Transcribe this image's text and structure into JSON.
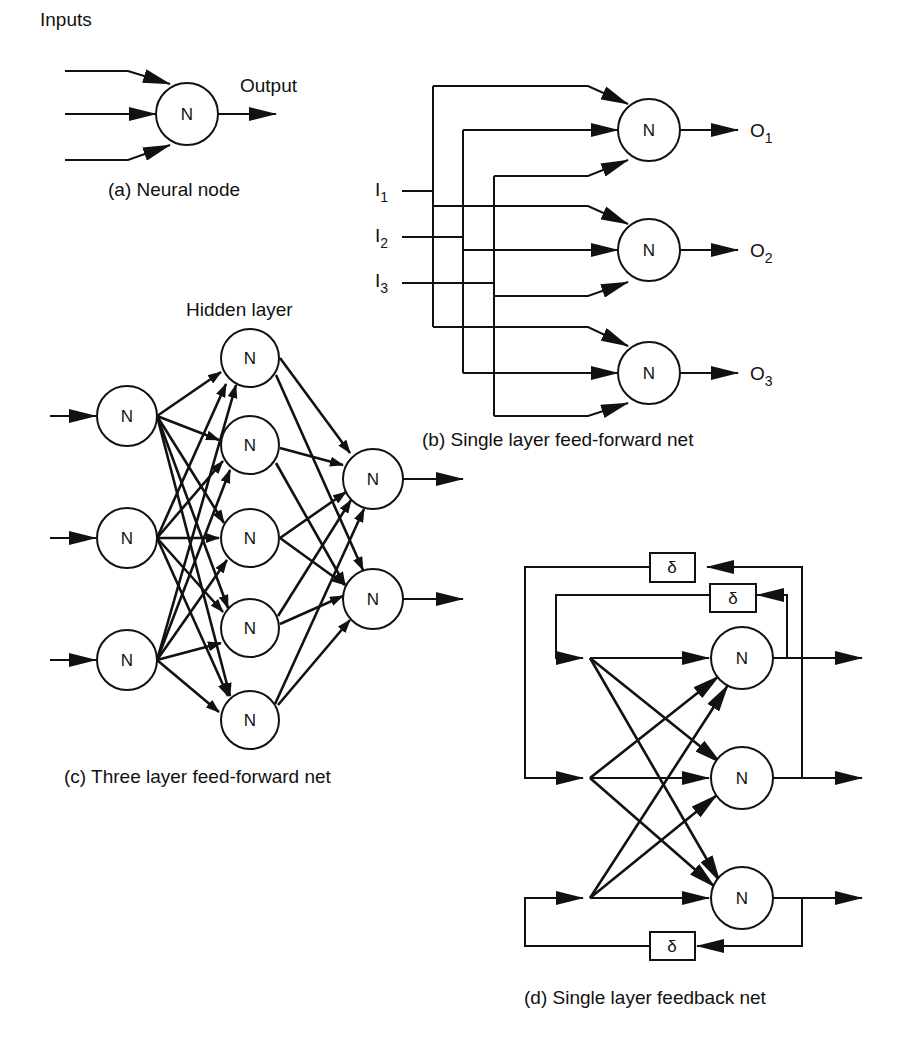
{
  "panels": {
    "a": {
      "caption": "(a) Neural node",
      "inputs_label": "Inputs",
      "output_label": "Output",
      "node_label": "N"
    },
    "b": {
      "caption": "(b) Single layer feed-forward net",
      "node_label": "N",
      "inputs": [
        {
          "base": "I",
          "sub": "1"
        },
        {
          "base": "I",
          "sub": "2"
        },
        {
          "base": "I",
          "sub": "3"
        }
      ],
      "outputs": [
        {
          "base": "O",
          "sub": "1"
        },
        {
          "base": "O",
          "sub": "2"
        },
        {
          "base": "O",
          "sub": "3"
        }
      ]
    },
    "c": {
      "caption": "(c) Three layer feed-forward net",
      "hidden_label": "Hidden layer",
      "node_label": "N",
      "layers": {
        "input": 3,
        "hidden": 5,
        "output": 2
      }
    },
    "d": {
      "caption": "(d) Single layer feedback net",
      "node_label": "N",
      "delay_label": "δ",
      "nodes": 3,
      "delays": 3
    }
  }
}
